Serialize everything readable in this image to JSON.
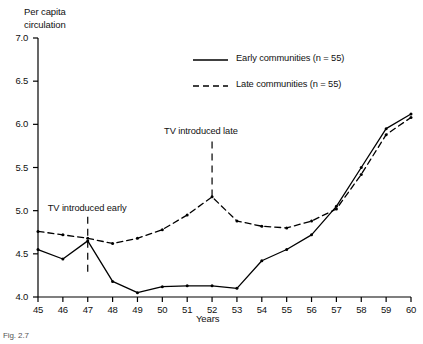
{
  "chart_data": {
    "type": "line",
    "title": "",
    "ylabel": "Per capita\ncirculation",
    "xlabel": "Years",
    "x": [
      45,
      46,
      47,
      48,
      49,
      50,
      51,
      52,
      53,
      54,
      55,
      56,
      57,
      58,
      59,
      60
    ],
    "xtick_labels": [
      "45",
      "46",
      "47",
      "48",
      "49",
      "50",
      "51",
      "52",
      "53",
      "54",
      "55",
      "56",
      "57",
      "58",
      "59",
      "60"
    ],
    "ytick_labels": [
      "4.0",
      "4.5",
      "5.0",
      "5.5",
      "6.0",
      "6.5",
      "7.0"
    ],
    "yticks": [
      4.0,
      4.5,
      5.0,
      5.5,
      6.0,
      6.5,
      7.0
    ],
    "ylim": [
      4.0,
      7.0
    ],
    "xlim": [
      45,
      60
    ],
    "grid": false,
    "legend_position": "upper-center",
    "series": [
      {
        "name": "Early communities (n = 55)",
        "style": "solid",
        "values": [
          4.55,
          4.44,
          4.65,
          4.18,
          4.05,
          4.12,
          4.13,
          4.13,
          4.1,
          4.42,
          4.55,
          4.72,
          5.05,
          5.5,
          5.95,
          6.12
        ]
      },
      {
        "name": "Late communities (n = 55)",
        "style": "dashed",
        "values": [
          4.76,
          4.72,
          4.68,
          4.62,
          4.68,
          4.78,
          4.95,
          5.16,
          4.88,
          4.82,
          4.8,
          4.88,
          5.02,
          5.42,
          5.88,
          6.08
        ]
      }
    ],
    "annotations": [
      {
        "text": "TV introduced early",
        "x": 47,
        "label_y": 4.98,
        "line_top": 4.93,
        "line_bottom": 4.25
      },
      {
        "text": "TV introduced late",
        "x": 52,
        "label_y": 5.88,
        "line_top": 5.8,
        "line_bottom": 5.16
      }
    ]
  },
  "legend": {
    "items": [
      {
        "label": "Early communities (n = 55)",
        "style": "solid"
      },
      {
        "label": "Late communities (n = 55)",
        "style": "dashed"
      }
    ]
  },
  "caption": {
    "text": "Fig. 2.7"
  },
  "colors": {
    "ink": "#000000",
    "background": "#ffffff"
  }
}
